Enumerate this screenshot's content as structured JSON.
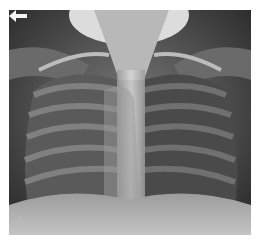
{
  "figure": {
    "panel_label": "A",
    "annotation": "arrow-pointing-left"
  }
}
